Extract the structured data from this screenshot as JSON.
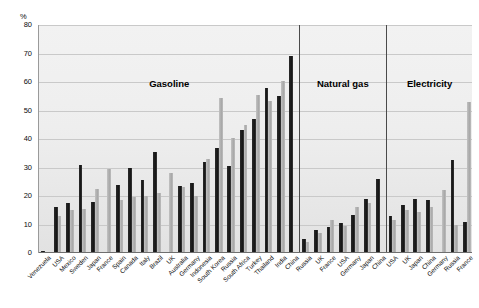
{
  "chart_data": {
    "type": "bar",
    "title": "",
    "subtitle": "",
    "xlabel": "",
    "ylabel": "%",
    "ylim": [
      0,
      80
    ],
    "yticks": [
      0,
      10,
      20,
      30,
      40,
      50,
      60,
      70,
      80
    ],
    "grid": true,
    "legend_position": "none",
    "series": [
      {
        "name": "dark",
        "color": "#1a1a1a"
      },
      {
        "name": "light",
        "color": "#b0b0b0"
      }
    ],
    "sections": [
      {
        "label": "Gasoline",
        "categories": [
          "Venezuela",
          "USA",
          "Mexico",
          "Sweden",
          "Japan",
          "France",
          "Spain",
          "Canada",
          "Italy",
          "Brazil",
          "UK",
          "Australia",
          "Germany",
          "Indonesia",
          "South Korea",
          "Russia",
          "South Africa",
          "Turkey",
          "Thailand",
          "India",
          "China"
        ],
        "dark": [
          0.6,
          16.0,
          17.5,
          31.0,
          18.0,
          0.0,
          24.0,
          30.0,
          25.5,
          35.5,
          0.0,
          23.5,
          24.5,
          32.0,
          37.0,
          30.5,
          43.0,
          47.0,
          58.0,
          55.0,
          69.0
        ],
        "light": [
          0.0,
          13.0,
          15.0,
          15.5,
          22.5,
          29.5,
          18.5,
          19.5,
          20.0,
          21.0,
          28.0,
          23.0,
          20.0,
          33.0,
          54.5,
          40.5,
          45.0,
          55.5,
          53.5,
          60.5,
          0.0
        ]
      },
      {
        "label": "Natural gas",
        "categories": [
          "Russia",
          "UK",
          "France",
          "USA",
          "Germany",
          "Japan",
          "China"
        ],
        "dark": [
          5.0,
          8.0,
          9.0,
          10.5,
          13.5,
          19.0,
          26.0
        ],
        "light": [
          4.0,
          7.0,
          11.5,
          9.5,
          16.0,
          17.5,
          0.0
        ]
      },
      {
        "label": "Electricity",
        "categories": [
          "USA",
          "UK",
          "Japan",
          "China",
          "Germany",
          "Russia",
          "France"
        ],
        "dark": [
          13.0,
          17.0,
          19.0,
          18.5,
          0.0,
          32.5,
          11.0
        ],
        "light": [
          11.5,
          15.0,
          14.5,
          16.0,
          22.0,
          10.0,
          53.0
        ]
      }
    ]
  }
}
